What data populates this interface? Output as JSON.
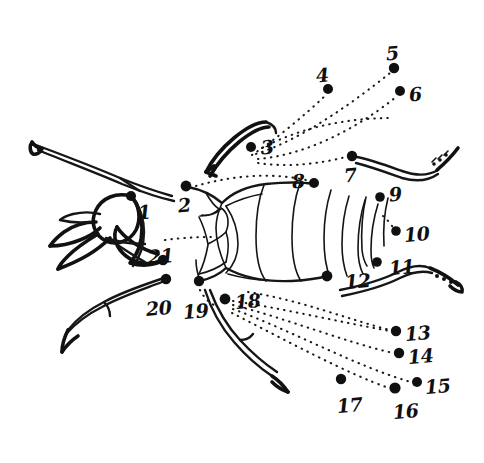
{
  "figure": {
    "kind": "hand-drawn-line-illustration",
    "background_color": "#ffffff",
    "ink_color": "#141414",
    "marker_color": "#101010",
    "width": 484,
    "height": 463,
    "label_count": 21
  },
  "labels": [
    {
      "id": 1,
      "text": "1",
      "tx": 138,
      "ty": 203,
      "dot_x": 131,
      "dot_y": 196,
      "dot_r": 5.0
    },
    {
      "id": 2,
      "text": "2",
      "tx": 178,
      "ty": 196,
      "dot_x": 186,
      "dot_y": 186,
      "dot_r": 5.4
    },
    {
      "id": 3,
      "text": "3",
      "tx": 261,
      "ty": 138,
      "dot_x": 251,
      "dot_y": 147,
      "dot_r": 5.0
    },
    {
      "id": 4,
      "text": "4",
      "tx": 316,
      "ty": 66,
      "dot_x": 328,
      "dot_y": 89,
      "dot_r": 5.0
    },
    {
      "id": 5,
      "text": "5",
      "tx": 386,
      "ty": 44,
      "dot_x": 394,
      "dot_y": 68,
      "dot_r": 5.2
    },
    {
      "id": 6,
      "text": "6",
      "tx": 409,
      "ty": 85,
      "dot_x": 400,
      "dot_y": 91,
      "dot_r": 5.0
    },
    {
      "id": 7,
      "text": "7",
      "tx": 344,
      "ty": 166,
      "dot_x": 352,
      "dot_y": 156,
      "dot_r": 5.2
    },
    {
      "id": 8,
      "text": "8",
      "tx": 292,
      "ty": 172,
      "dot_x": 314,
      "dot_y": 183,
      "dot_r": 5.0
    },
    {
      "id": 9,
      "text": "9",
      "tx": 389,
      "ty": 185,
      "dot_x": 380,
      "dot_y": 197,
      "dot_r": 4.8
    },
    {
      "id": 10,
      "text": "10",
      "tx": 404,
      "ty": 225,
      "dot_x": 396,
      "dot_y": 231,
      "dot_r": 4.8
    },
    {
      "id": 11,
      "text": "11",
      "tx": 389,
      "ty": 258,
      "dot_x": 377,
      "dot_y": 262,
      "dot_r": 4.8
    },
    {
      "id": 12,
      "text": "12",
      "tx": 345,
      "ty": 272,
      "dot_x": 327,
      "dot_y": 276,
      "dot_r": 5.4
    },
    {
      "id": 13,
      "text": "13",
      "tx": 405,
      "ty": 324,
      "dot_x": 396,
      "dot_y": 331,
      "dot_r": 5.2
    },
    {
      "id": 14,
      "text": "14",
      "tx": 408,
      "ty": 347,
      "dot_x": 399,
      "dot_y": 353,
      "dot_r": 5.2
    },
    {
      "id": 15,
      "text": "15",
      "tx": 425,
      "ty": 377,
      "dot_x": 417,
      "dot_y": 382,
      "dot_r": 5.0
    },
    {
      "id": 16,
      "text": "16",
      "tx": 393,
      "ty": 402,
      "dot_x": 395,
      "dot_y": 388,
      "dot_r": 5.6
    },
    {
      "id": 17,
      "text": "17",
      "tx": 337,
      "ty": 396,
      "dot_x": 341,
      "dot_y": 379,
      "dot_r": 5.2
    },
    {
      "id": 18,
      "text": "18",
      "tx": 235,
      "ty": 292,
      "dot_x": 225,
      "dot_y": 299,
      "dot_r": 5.4
    },
    {
      "id": 19,
      "text": "19",
      "tx": 183,
      "ty": 302,
      "dot_x": 199,
      "dot_y": 281,
      "dot_r": 5.2
    },
    {
      "id": 20,
      "text": "20",
      "tx": 146,
      "ty": 299,
      "dot_x": 166,
      "dot_y": 279,
      "dot_r": 5.2
    },
    {
      "id": 21,
      "text": "21",
      "tx": 148,
      "ty": 247,
      "dot_x": 163,
      "dot_y": 260,
      "dot_r": 5.2
    }
  ],
  "leader_lines": [
    {
      "name": "leader-to-4",
      "from_label": 3,
      "to_label": 4,
      "path": "M 252 155 C 275 140 305 115 326 95"
    },
    {
      "name": "leader-to-5",
      "from_label": 3,
      "to_label": 5,
      "path": "M 256 154 C 300 140 350 105 390 73"
    },
    {
      "name": "leader-to-6",
      "from_label": 3,
      "to_label": 6,
      "path": "M 258 159 C 305 155 355 130 396 97"
    },
    {
      "name": "leader-to-7",
      "from_label": 3,
      "to_label": 7,
      "path": "M 258 163 C 290 168 322 163 346 157"
    },
    {
      "name": "leader-upper-arc",
      "from_label": 3,
      "to_label": 6,
      "path": "M 262 148 C 300 128 345 118 392 118"
    },
    {
      "name": "leader-left-1",
      "from_label": 1,
      "to_label": 21,
      "path": "M 165 240 C 180 238 196 237 212 237"
    },
    {
      "name": "leader-18-to-13",
      "from_label": 18,
      "to_label": 13,
      "path": "M 233 301 C 280 308 340 322 390 331"
    },
    {
      "name": "leader-18-to-14",
      "from_label": 18,
      "to_label": 14,
      "path": "M 233 305 C 285 318 345 342 393 353"
    },
    {
      "name": "leader-18-to-15",
      "from_label": 18,
      "to_label": 15,
      "path": "M 233 309 C 290 330 360 368 411 382"
    },
    {
      "name": "leader-18-to-16",
      "from_label": 18,
      "to_label": 16,
      "path": "M 232 313 C 285 340 350 375 389 388"
    },
    {
      "name": "leader-12-to-13",
      "from_label": 12,
      "to_label": 13,
      "path": "M 248 292 C 300 300 350 320 390 330"
    },
    {
      "name": "leader-19-up",
      "from_label": 19,
      "to_label": 18,
      "path": "M 200 290 C 203 296 208 302 214 305"
    },
    {
      "name": "leader-10-marker",
      "from_label": 10,
      "to_label": 10,
      "path": "M 383 216 C 388 220 392 226 395 230"
    },
    {
      "name": "leader-2-body",
      "from_label": 2,
      "to_label": 8,
      "path": "M 196 186 C 230 176 270 172 306 180"
    }
  ],
  "body_outline": {
    "name": "body-and-appendages",
    "segments": [
      "thorax-outline",
      "abdominal-segments",
      "head-capsule",
      "mandibles",
      "legs",
      "palps",
      "antenna"
    ]
  }
}
